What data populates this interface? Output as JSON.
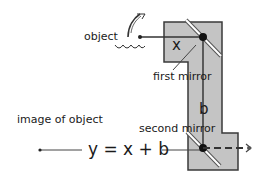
{
  "diagram": {
    "type": "periscope optics diagram",
    "labels": {
      "object": "object",
      "first_mirror": "first mirror",
      "second_mirror": "second mirror",
      "image_of_object": "image of object",
      "x_var": "x",
      "b_var": "b",
      "equation": "y = x + b"
    },
    "colors": {
      "body_fill": "#c4c4c4",
      "outline": "#3a3a3a",
      "ray": "#333333",
      "background": "#ffffff"
    },
    "icons": [
      "feather-icon",
      "water-wave-icon",
      "eye-icon"
    ]
  }
}
